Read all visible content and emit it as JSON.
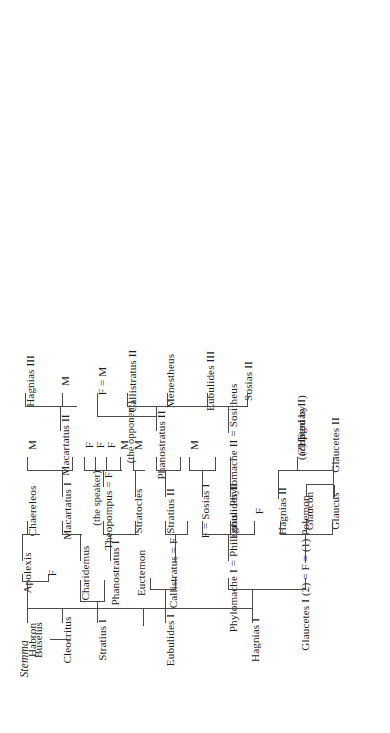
{
  "document": {
    "title": "Stemma",
    "type": "genealogical-stemma",
    "orientation": "rotated-90-counterclockwise",
    "subject": "The family of Buselus (Isaeus 11, Hagnias inheritance)"
  },
  "generations": [
    {
      "index": 0,
      "label": "generation-1",
      "people": [
        {
          "id": "buselus",
          "name": "Buselus"
        }
      ]
    },
    {
      "index": 1,
      "label": "generation-2",
      "people": [
        {
          "id": "hagnias-i",
          "name": "Hagnias I"
        },
        {
          "id": "eubulides-i",
          "name": "Eubulides I"
        },
        {
          "id": "stratius-i",
          "name": "Stratius I"
        },
        {
          "id": "cleocritus",
          "name": "Cleocritus"
        },
        {
          "id": "habron",
          "name": "Habron"
        }
      ]
    },
    {
      "index": 2,
      "label": "generation-3",
      "people": [
        {
          "id": "glaucetes-i-polemon",
          "name": "Glaucetes I (2) = F = (1) Polemon"
        },
        {
          "id": "phylomache-i-philagrus",
          "name": "Phylomache I = Philagrus"
        },
        {
          "id": "callistratus-f",
          "name": "Callistratus = F"
        },
        {
          "id": "euctemon",
          "name": "Euctemon"
        },
        {
          "id": "phanostratus-i",
          "name": "Phanostratus I"
        },
        {
          "id": "charidemus",
          "name": "Charidemus"
        },
        {
          "id": "habron-f",
          "name": "F"
        },
        {
          "id": "apolexis",
          "name": "Apolexis"
        }
      ]
    },
    {
      "index": 3,
      "label": "generation-4",
      "people": [
        {
          "id": "glaucus",
          "name": "Glaucus"
        },
        {
          "id": "glaucon",
          "name": "Glaucon"
        },
        {
          "id": "hagnias-ii",
          "name": "Hagnias II"
        },
        {
          "id": "hagnias-ii-sister",
          "name": "F"
        },
        {
          "id": "eubulides-ii",
          "name": "Eubulides II"
        },
        {
          "id": "f-sosias-i",
          "name": "F = Sosias I"
        },
        {
          "id": "stratius-ii",
          "name": "Stratius II"
        },
        {
          "id": "stratocles",
          "name": "Stratocles"
        },
        {
          "id": "theopompus-f",
          "name": "Theopompus = F"
        },
        {
          "id": "theopompus-note",
          "name": "(the speaker)"
        },
        {
          "id": "macartatus-i",
          "name": "Macartatus I"
        },
        {
          "id": "chaereleos",
          "name": "Chaereleos"
        }
      ]
    },
    {
      "index": 4,
      "label": "generation-5",
      "people": [
        {
          "id": "glaucetes-ii",
          "name": "Glaucetes II"
        },
        {
          "id": "adopted-f",
          "name": "(?) F"
        },
        {
          "id": "adopted-note-1",
          "name": "(adopted by"
        },
        {
          "id": "adopted-note-2",
          "name": "Hagnias II)"
        },
        {
          "id": "phylomache-ii-sositheus",
          "name": "Phylomache II = Sositheus"
        },
        {
          "id": "sositheus-m",
          "name": "M"
        },
        {
          "id": "phanostratus-ii",
          "name": "Phanostratus II"
        },
        {
          "id": "stratocles-m",
          "name": "M"
        },
        {
          "id": "opponent-m",
          "name": "M"
        },
        {
          "id": "opponent-note",
          "name": "(the opponent)"
        },
        {
          "id": "stratocles-f1",
          "name": "F"
        },
        {
          "id": "stratocles-f2",
          "name": "F"
        },
        {
          "id": "stratocles-f3",
          "name": "F"
        },
        {
          "id": "macartatus-ii",
          "name": "Macartatus II"
        },
        {
          "id": "macartatus-ii-m",
          "name": "M"
        }
      ]
    },
    {
      "index": 5,
      "label": "generation-6",
      "people": [
        {
          "id": "sosias-ii",
          "name": "Sosias II"
        },
        {
          "id": "eubulides-iii",
          "name": "Eubulides III"
        },
        {
          "id": "menestheus",
          "name": "Menestheus"
        },
        {
          "id": "callistratus-ii",
          "name": "Callistratus II"
        },
        {
          "id": "f-equals-m",
          "name": "F = M"
        },
        {
          "id": "macartatus-child-m",
          "name": "M"
        },
        {
          "id": "hagnias-iii",
          "name": "Hagnias III"
        }
      ]
    }
  ],
  "labels": {
    "buselus": "Buselus",
    "hagnias_i": "Hagnias I",
    "eubulides_i": "Eubulides I",
    "stratius_i": "Stratius I",
    "cleocritus": "Cleocritus",
    "habron": "Habron",
    "glaucetes_i_polemon": "Glaucetes I (2) = F = (1) Polemon",
    "phylomache_i_philagrus": "Phylomache I = Philagrus",
    "callistratus_f": "Callistratus = F",
    "euctemon": "Euctemon",
    "phanostratus_i": "Phanostratus I",
    "charidemus": "Charidemus",
    "habron_f": "F",
    "apolexis": "Apolexis",
    "glaucus": "Glaucus",
    "glaucon": "Glaucon",
    "hagnias_ii": "Hagnias II",
    "hagnias_ii_f": "F",
    "eubulides_ii": "Eubulides II",
    "f_sosias_i": "F = Sosias I",
    "stratius_ii": "Stratius II",
    "stratocles": "Stratocles",
    "theopompus_f": "Theopompus = F",
    "speaker_note": "(the speaker)",
    "macartatus_i": "Macartatus I",
    "chaereleos": "Chaereleos",
    "glaucetes_ii": "Glaucetes II",
    "adopted_f": "(?) F",
    "adopted_note_1": "(adopted by",
    "adopted_note_2": "Hagnias II)",
    "phylomache_ii_sositheus": "Phylomache II = Sositheus",
    "sositheus_m": "M",
    "phanostratus_ii": "Phanostratus II",
    "stratocles_m": "M",
    "opponent_m": "M",
    "opponent_note": "(the opponent)",
    "stratocles_f1": "F",
    "stratocles_f2": "F",
    "stratocles_f3": "F",
    "macartatus_ii": "Macartatus II",
    "macartatus_ii_m": "M",
    "sosias_ii": "Sosias II",
    "eubulides_iii": "Eubulides III",
    "menestheus": "Menestheus",
    "callistratus_ii": "Callistratus II",
    "f_equals_m": "F = M",
    "macartatus_child_m": "M",
    "hagnias_iii": "Hagnias III",
    "stemma": "Stemma"
  },
  "style": {
    "page_background": "#ffffff",
    "text_color": "#1b1b1b",
    "line_color": "#4a4a4a"
  }
}
